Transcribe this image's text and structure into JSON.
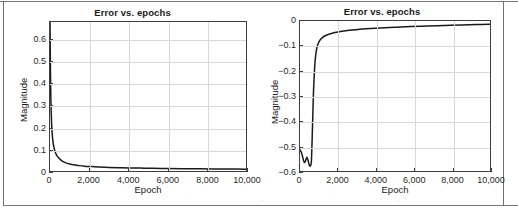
{
  "figure": {
    "border_color": "#6f6f6f",
    "background": "#ffffff"
  },
  "chart_data": [
    {
      "id": "left",
      "type": "line",
      "title": "Error vs. epochs",
      "xlabel": "Epoch",
      "ylabel": "Magnitude",
      "xlim": [
        0,
        10000
      ],
      "ylim": [
        0,
        0.68
      ],
      "grid": true,
      "legend": null,
      "line_color": "#1a1a1a",
      "xticks": [
        0,
        2000,
        4000,
        6000,
        8000,
        10000
      ],
      "xticklabels": [
        "0",
        "2,000",
        "4,000",
        "6,000",
        "8,000",
        "10,000"
      ],
      "yticks": [
        0,
        0.1,
        0.2,
        0.3,
        0.4,
        0.5,
        0.6
      ],
      "yticklabels": [
        "0",
        "0.1",
        "0.2",
        "0.3",
        "0.4",
        "0.5",
        "0.6"
      ],
      "series": [
        {
          "name": "error",
          "x": [
            0,
            30,
            60,
            100,
            150,
            200,
            280,
            360,
            450,
            560,
            700,
            850,
            1000,
            1200,
            1450,
            1750,
            2100,
            2500,
            3000,
            3500,
            4000,
            4600,
            5200,
            6000,
            6800,
            7600,
            8400,
            9200,
            10000
          ],
          "y": [
            0.68,
            0.4,
            0.27,
            0.185,
            0.135,
            0.108,
            0.083,
            0.069,
            0.059,
            0.05,
            0.042,
            0.036,
            0.032,
            0.028,
            0.025,
            0.022,
            0.02,
            0.0182,
            0.0165,
            0.0152,
            0.0142,
            0.0132,
            0.0124,
            0.0115,
            0.0107,
            0.01,
            0.0094,
            0.0089,
            0.0085
          ]
        }
      ]
    },
    {
      "id": "right",
      "type": "line",
      "title": "Error vs. epochs",
      "xlabel": "Epoch",
      "ylabel": "Magnitude",
      "xlim": [
        0,
        10000
      ],
      "ylim": [
        -0.6,
        0
      ],
      "grid": true,
      "legend": null,
      "line_color": "#1a1a1a",
      "xticks": [
        0,
        2000,
        4000,
        6000,
        8000,
        10000
      ],
      "xticklabels": [
        "0",
        "2,000",
        "4,000",
        "6,000",
        "8,000",
        "10,000"
      ],
      "yticks": [
        0,
        -0.1,
        -0.2,
        -0.3,
        -0.4,
        -0.5,
        -0.6
      ],
      "yticklabels": [
        "0",
        "−0.1",
        "−0.2",
        "−0.3",
        "−0.4",
        "−0.5",
        "−0.6"
      ],
      "series": [
        {
          "name": "error",
          "x": [
            0,
            60,
            120,
            180,
            240,
            300,
            360,
            420,
            470,
            520,
            560,
            600,
            640,
            680,
            720,
            780,
            840,
            920,
            1000,
            1100,
            1250,
            1450,
            1700,
            2000,
            2400,
            2900,
            3500,
            4200,
            5000,
            5800,
            6700,
            7600,
            8500,
            9300,
            10000
          ],
          "y": [
            -0.515,
            -0.523,
            -0.538,
            -0.556,
            -0.566,
            -0.558,
            -0.545,
            -0.556,
            -0.572,
            -0.58,
            -0.578,
            -0.56,
            -0.47,
            -0.36,
            -0.265,
            -0.175,
            -0.128,
            -0.098,
            -0.083,
            -0.072,
            -0.062,
            -0.055,
            -0.049,
            -0.044,
            -0.039,
            -0.035,
            -0.031,
            -0.028,
            -0.025,
            -0.022,
            -0.02,
            -0.018,
            -0.016,
            -0.014,
            -0.013
          ]
        }
      ]
    }
  ]
}
